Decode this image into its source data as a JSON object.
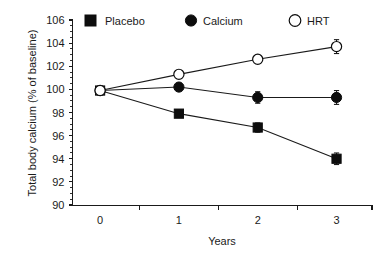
{
  "chart_data": {
    "type": "line",
    "title": "",
    "xlabel": "Years",
    "ylabel": "Total body calcium (% of baseline)",
    "x": [
      0,
      1,
      2,
      3
    ],
    "xtick_labels": [
      "0",
      "1",
      "2",
      "3"
    ],
    "xlim": [
      -0.35,
      3.45
    ],
    "ylim": [
      90,
      106
    ],
    "ytick_labels": [
      "90",
      "92",
      "94",
      "96",
      "98",
      "100",
      "102",
      "104",
      "106"
    ],
    "ytick_values": [
      90,
      92,
      94,
      96,
      98,
      100,
      102,
      104,
      106
    ],
    "yminor_step": 0.5,
    "grid": false,
    "legend_position": "top",
    "series": [
      {
        "name": "Placebo",
        "marker": "filled-square",
        "values": [
          99.9,
          97.9,
          96.7,
          94.0
        ],
        "errors": [
          0.0,
          0.3,
          0.4,
          0.5
        ]
      },
      {
        "name": "Calcium",
        "marker": "filled-circle",
        "values": [
          99.9,
          100.2,
          99.3,
          99.3
        ],
        "errors": [
          0.0,
          0.3,
          0.5,
          0.6
        ]
      },
      {
        "name": "HRT",
        "marker": "open-circle",
        "values": [
          99.9,
          101.3,
          102.6,
          103.7
        ],
        "errors": [
          0.0,
          0.35,
          0.35,
          0.6
        ]
      }
    ]
  },
  "legend": {
    "items": [
      {
        "label": "Placebo",
        "marker": "filled-square"
      },
      {
        "label": "Calcium",
        "marker": "filled-circle"
      },
      {
        "label": "HRT",
        "marker": "open-circle"
      }
    ]
  },
  "colors": {
    "ink": "#1a1a1a",
    "marker": "#0d0d0d",
    "background": "#ffffff"
  }
}
